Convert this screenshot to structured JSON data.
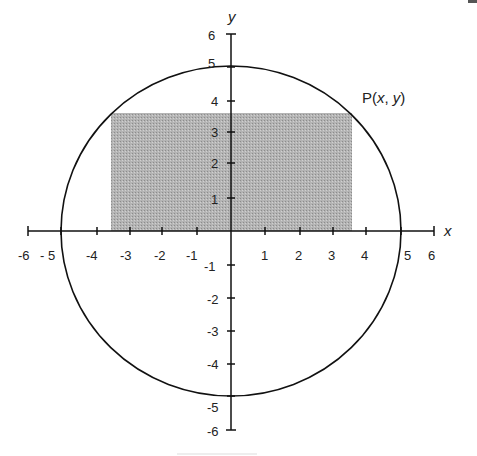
{
  "diagram": {
    "type": "coordinate-plane",
    "x_axis": {
      "label": "x",
      "tick_labels": [
        "-6",
        "- 5",
        "-4",
        "-3",
        "-2",
        "-1",
        "1",
        "2",
        "3",
        "4",
        "5",
        "6"
      ]
    },
    "y_axis": {
      "label": "y",
      "tick_labels": [
        "6",
        "5",
        "4",
        "3",
        "2",
        "1",
        "-1",
        "-2",
        "-3",
        "-4",
        "-5",
        "-6"
      ]
    },
    "circle": {
      "center": "(0, 0)",
      "radius": 5
    },
    "rectangle": {
      "corners": "(±3.5, 0) to (±3.5, 3.6)",
      "fill": "#b0b0b0"
    },
    "point_label": "P(x, y)",
    "point_label_parts": {
      "p": "P",
      "open": "(",
      "x": "x",
      "comma": ", ",
      "y": "y",
      "close": ")"
    }
  }
}
